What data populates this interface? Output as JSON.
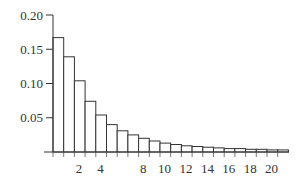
{
  "chart_data": {
    "type": "bar",
    "title": "",
    "xlabel": "",
    "ylabel": "",
    "categories": [
      1,
      2,
      3,
      4,
      5,
      6,
      7,
      8,
      9,
      10,
      11,
      12,
      13,
      14,
      15,
      16,
      17,
      18,
      19,
      20,
      21,
      22
    ],
    "values": [
      0.167,
      0.139,
      0.104,
      0.074,
      0.054,
      0.04,
      0.031,
      0.025,
      0.02,
      0.016,
      0.013,
      0.011,
      0.009,
      0.008,
      0.007,
      0.006,
      0.005,
      0.005,
      0.004,
      0.004,
      0.003,
      0.003
    ],
    "ylim": [
      0,
      0.2
    ],
    "yticks": [
      "0.05",
      "0.10",
      "0.15",
      "0.20"
    ],
    "ytick_values": [
      0.05,
      0.1,
      0.15,
      0.2
    ],
    "xtick_labels": [
      "2",
      "4",
      "8",
      "10",
      "12",
      "14",
      "16",
      "18",
      "20"
    ],
    "xtick_values": [
      2,
      4,
      8,
      10,
      12,
      14,
      16,
      18,
      20
    ],
    "grid": false,
    "legend": null,
    "bar_fill": "#ffffff",
    "bar_edge": "#333333"
  }
}
